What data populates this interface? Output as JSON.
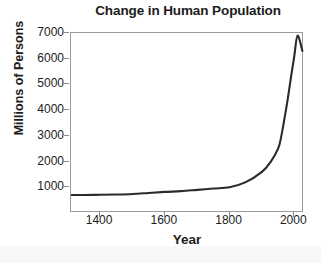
{
  "chart_data": {
    "type": "line",
    "title": "Change in Human Population",
    "xlabel": "Year",
    "ylabel": "Millions of Persons",
    "xlim": [
      1310,
      2030
    ],
    "ylim": [
      0,
      7000
    ],
    "grid": false,
    "legend": null,
    "xticks": [
      1400,
      1600,
      1800,
      2000
    ],
    "xtick_labels": [
      "1400",
      "1600",
      "1800",
      "2000"
    ],
    "yticks": [
      1000,
      2000,
      3000,
      4000,
      5000,
      6000,
      7000
    ],
    "ytick_labels": [
      "1000",
      "2000",
      "3000",
      "4000",
      "5000",
      "6000",
      "7000"
    ],
    "series": [
      {
        "name": "World population",
        "color": "#2b2b2b",
        "x": [
          1310,
          1350,
          1400,
          1450,
          1500,
          1550,
          1600,
          1650,
          1700,
          1750,
          1800,
          1850,
          1900,
          1925,
          1950,
          1960,
          1970,
          1980,
          1990,
          2000,
          2010,
          2025
        ],
        "values": [
          700,
          700,
          710,
          720,
          740,
          780,
          820,
          850,
          900,
          950,
          1000,
          1200,
          1600,
          1950,
          2500,
          3000,
          3700,
          4450,
          5300,
          6100,
          6900,
          6300
        ]
      }
    ]
  },
  "axes": {
    "frame_color": "#9a9a9a",
    "tick_color": "#8a8a8a",
    "text_color": "#1c1c1c"
  },
  "figure": {
    "background": "#ffffff"
  }
}
